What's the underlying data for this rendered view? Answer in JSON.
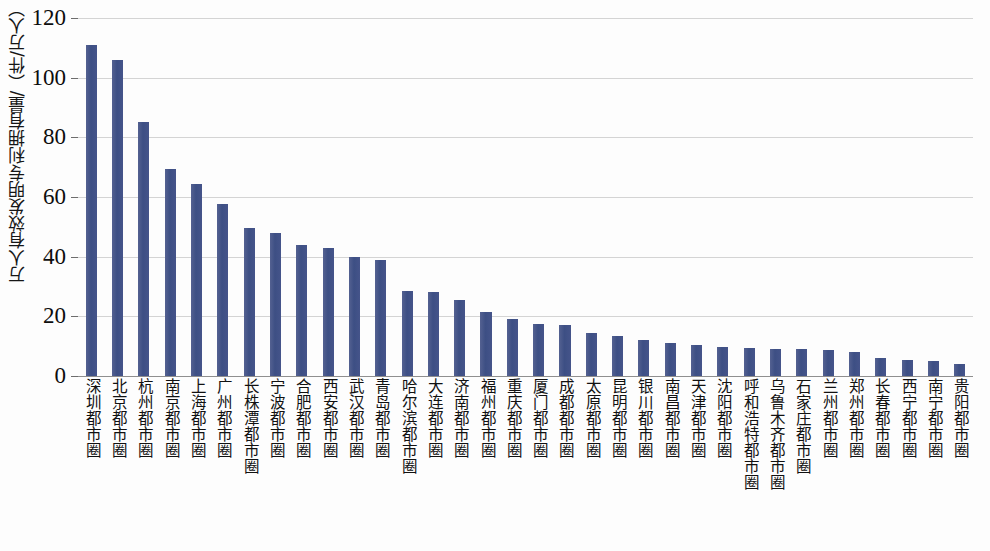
{
  "chart_data": {
    "type": "bar",
    "title": "",
    "xlabel": "",
    "ylabel": "万人有效发明专利拥有量/（件/万人）",
    "ylim": [
      0,
      120
    ],
    "ytick_labels": [
      "0",
      "20",
      "40",
      "60",
      "80",
      "100",
      "120"
    ],
    "yticks": [
      0,
      20,
      40,
      60,
      80,
      100,
      120
    ],
    "grid": true,
    "legend": "none",
    "bar_color": "#44538a",
    "categories": [
      "深圳都市圈",
      "北京都市圈",
      "杭州都市圈",
      "南京都市圈",
      "上海都市圈",
      "广州都市圈",
      "长株潭都市圈",
      "宁波都市圈",
      "合肥都市圈",
      "西安都市圈",
      "武汉都市圈",
      "青岛都市圈",
      "哈尔滨都市圈",
      "大连都市圈",
      "济南都市圈",
      "福州都市圈",
      "重庆都市圈",
      "厦门都市圈",
      "成都都市圈",
      "太原都市圈",
      "昆明都市圈",
      "银川都市圈",
      "南昌都市圈",
      "天津都市圈",
      "沈阳都市圈",
      "呼和浩特都市圈",
      "乌鲁木齐都市圈",
      "石家庄都市圈",
      "兰州都市圈",
      "郑州都市圈",
      "长春都市圈",
      "西宁都市圈",
      "南宁都市圈",
      "贵阳都市圈"
    ],
    "values": [
      111,
      106,
      85,
      69.5,
      64.5,
      57.5,
      49.5,
      48,
      44,
      43,
      40,
      39,
      28.5,
      28,
      25.5,
      21.5,
      19,
      17.5,
      17,
      14.5,
      13.5,
      12,
      11,
      10.5,
      9.8,
      9.5,
      9.2,
      9,
      8.6,
      8.2,
      6,
      5.5,
      5,
      4
    ]
  }
}
